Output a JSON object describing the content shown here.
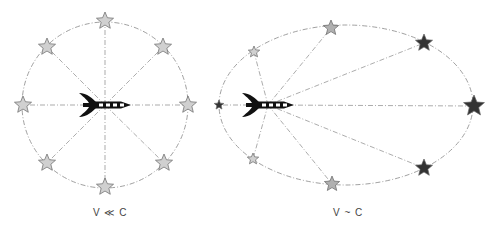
{
  "panels": [
    {
      "id": "slow",
      "caption": "V ≪ C",
      "shape": "circle",
      "center": [
        105,
        105
      ],
      "radius": [
        83,
        83
      ],
      "observer": [
        105,
        105
      ],
      "stars": [
        {
          "pos": [
            105,
            21
          ],
          "size": 9,
          "fill": "#d0d0d0"
        },
        {
          "pos": [
            163,
            47
          ],
          "size": 9,
          "fill": "#d0d0d0"
        },
        {
          "pos": [
            188,
            105
          ],
          "size": 9,
          "fill": "#d0d0d0"
        },
        {
          "pos": [
            164,
            163
          ],
          "size": 9,
          "fill": "#d0d0d0"
        },
        {
          "pos": [
            105,
            187
          ],
          "size": 9,
          "fill": "#d0d0d0"
        },
        {
          "pos": [
            47,
            163
          ],
          "size": 9,
          "fill": "#d0d0d0"
        },
        {
          "pos": [
            23,
            105
          ],
          "size": 9,
          "fill": "#d0d0d0"
        },
        {
          "pos": [
            47,
            47
          ],
          "size": 9,
          "fill": "#d0d0d0"
        }
      ]
    },
    {
      "id": "fast",
      "caption": "V ~ C",
      "shape": "ellipse",
      "center": [
        346,
        105
      ],
      "radius": [
        127,
        80
      ],
      "observer": [
        268,
        105
      ],
      "stars": [
        {
          "pos": [
            219,
            105
          ],
          "size": 5,
          "fill": "#333333"
        },
        {
          "pos": [
            254,
            52
          ],
          "size": 6,
          "fill": "#d0d0d0"
        },
        {
          "pos": [
            331,
            28
          ],
          "size": 8,
          "fill": "#b0b0b0"
        },
        {
          "pos": [
            424,
            43
          ],
          "size": 9,
          "fill": "#333333"
        },
        {
          "pos": [
            474,
            106
          ],
          "size": 11,
          "fill": "#333333"
        },
        {
          "pos": [
            424,
            168
          ],
          "size": 9,
          "fill": "#333333"
        },
        {
          "pos": [
            332,
            184
          ],
          "size": 8,
          "fill": "#b0b0b0"
        },
        {
          "pos": [
            253,
            159
          ],
          "size": 6,
          "fill": "#d0d0d0"
        }
      ]
    }
  ],
  "colors": {
    "line": "#888888",
    "star_stroke": "#666666",
    "rocket": "#111111",
    "caption": "#444444"
  }
}
